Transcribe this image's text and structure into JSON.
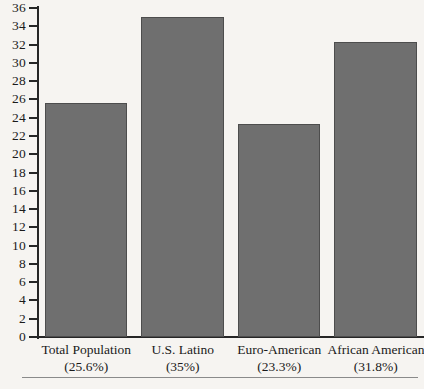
{
  "chart_data": {
    "type": "bar",
    "title": "",
    "xlabel": "",
    "ylabel": "",
    "ylim": [
      0,
      36
    ],
    "ytick_step": 2,
    "grid": false,
    "legend": null,
    "bar_color": "#6f6f6f",
    "background_color": "#f6f4f1",
    "categories": [
      "Total Population",
      "U.S. Latino",
      "Euro-American",
      "African American"
    ],
    "category_sublabels": [
      "(25.6%)",
      "(35%)",
      "(23.3%)",
      "(31.8%)"
    ],
    "values": [
      25.6,
      35.0,
      23.3,
      32.3
    ],
    "yticks": [
      "0",
      "2",
      "4",
      "6",
      "8",
      "10",
      "12",
      "14",
      "16",
      "18",
      "20",
      "22",
      "24",
      "26",
      "28",
      "30",
      "32",
      "34",
      "36"
    ]
  }
}
